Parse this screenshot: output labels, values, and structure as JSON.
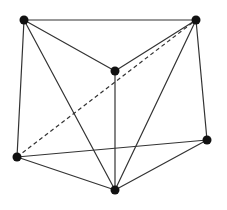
{
  "diagram": {
    "type": "graph",
    "width": 227,
    "height": 210,
    "colors": {
      "background": "#ffffff",
      "edge": "#333333",
      "vertex": "#111111"
    },
    "vertex_radius": 4.5,
    "vertices": [
      {
        "id": "A",
        "name": "top-left",
        "x": 24,
        "y": 20
      },
      {
        "id": "B",
        "name": "top-right",
        "x": 196,
        "y": 20
      },
      {
        "id": "C",
        "name": "center",
        "x": 115,
        "y": 71
      },
      {
        "id": "D",
        "name": "left",
        "x": 17,
        "y": 157
      },
      {
        "id": "E",
        "name": "right",
        "x": 207,
        "y": 140
      },
      {
        "id": "F",
        "name": "bottom",
        "x": 115,
        "y": 190
      }
    ],
    "edges": [
      {
        "from": "A",
        "to": "B",
        "style": "solid"
      },
      {
        "from": "A",
        "to": "C",
        "style": "solid"
      },
      {
        "from": "A",
        "to": "D",
        "style": "solid"
      },
      {
        "from": "A",
        "to": "F",
        "style": "solid"
      },
      {
        "from": "B",
        "to": "C",
        "style": "solid"
      },
      {
        "from": "B",
        "to": "F",
        "style": "solid"
      },
      {
        "from": "B",
        "to": "E",
        "style": "solid"
      },
      {
        "from": "C",
        "to": "F",
        "style": "solid"
      },
      {
        "from": "D",
        "to": "E",
        "style": "solid"
      },
      {
        "from": "D",
        "to": "F",
        "style": "solid"
      },
      {
        "from": "E",
        "to": "F",
        "style": "solid"
      },
      {
        "from": "D",
        "to": "B",
        "style": "dashed"
      }
    ]
  }
}
